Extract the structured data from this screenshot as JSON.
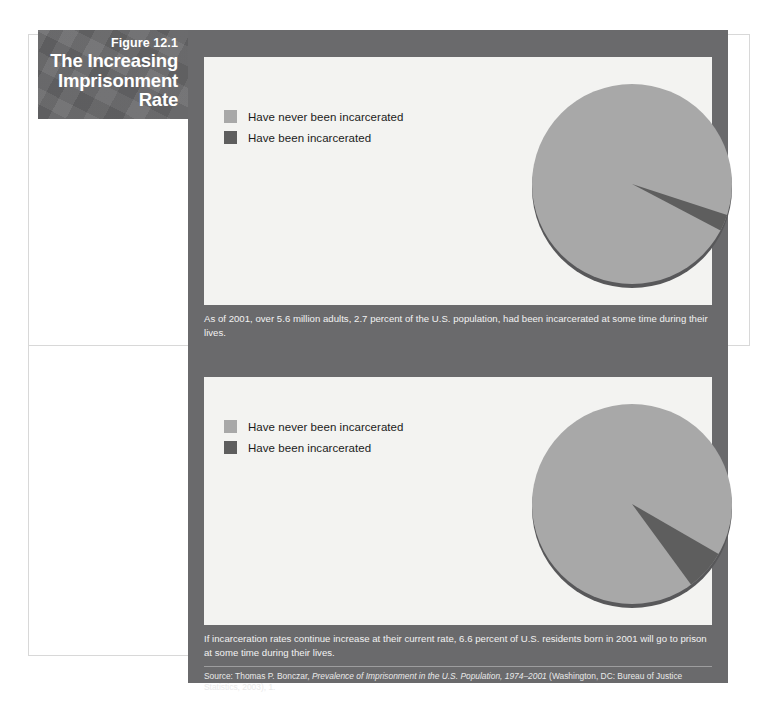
{
  "figure": {
    "number": "Figure 12.1",
    "title": "The Increasing Imprisonment Rate"
  },
  "colors": {
    "title_block_bg": "#68686a",
    "figure_body_bg": "#6a6a6c",
    "panel_bg": "#f3f3f1",
    "slice_never": "#a8a8a8",
    "slice_been": "#5e5e5e",
    "caption_text": "#f2f2f2"
  },
  "charts": [
    {
      "legend": [
        {
          "label": "Have never been incarcerated",
          "swatch": "light"
        },
        {
          "label": "Have been incarcerated",
          "swatch": "dark"
        }
      ],
      "caption": "As of 2001, over 5.6 million adults, 2.7 percent of the U.S. population, had been incarcerated at some time during their lives."
    },
    {
      "legend": [
        {
          "label": "Have never been incarcerated",
          "swatch": "light"
        },
        {
          "label": "Have been incarcerated",
          "swatch": "dark"
        }
      ],
      "caption": "If incarceration rates continue increase at their current rate, 6.6 percent of U.S. residents born in 2001 will go to prison at some time during their lives."
    }
  ],
  "source": {
    "prefix": "Source: Thomas P. Bonczar, ",
    "italic": "Prevalence of Imprisonment in the U.S. Population, 1974–2001",
    "suffix": " (Washington, DC: Bureau of Justice Statistics, 2003), 1."
  },
  "chart_data": [
    {
      "type": "pie",
      "title": "Imprisonment rate as of 2001",
      "categories": [
        "Have never been incarcerated",
        "Have been incarcerated"
      ],
      "values": [
        97.3,
        2.7
      ],
      "unit": "percent",
      "colors": [
        "#a8a8a8",
        "#5e5e5e"
      ],
      "legend_position": "left",
      "start_angle_deg": -18,
      "annotation": "2.7 percent of the U.S. population (over 5.6 million adults) had been incarcerated at some time during their lives."
    },
    {
      "type": "pie",
      "title": "Projected imprisonment rate for residents born in 2001",
      "categories": [
        "Have never been incarcerated",
        "Have been incarcerated"
      ],
      "values": [
        93.4,
        6.6
      ],
      "unit": "percent",
      "colors": [
        "#a8a8a8",
        "#5e5e5e"
      ],
      "legend_position": "left",
      "start_angle_deg": -30,
      "annotation": "6.6 percent of U.S. residents born in 2001 will go to prison at some time during their lives."
    }
  ]
}
